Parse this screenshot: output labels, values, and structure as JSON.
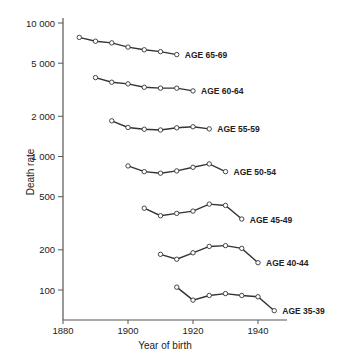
{
  "chart_data": {
    "type": "line",
    "title": "",
    "xlabel": "Year of birth",
    "ylabel": "Death rate",
    "yscale": "log",
    "xlim": [
      1880,
      1950
    ],
    "ylim": [
      60,
      10000
    ],
    "x_ticks": [
      1880,
      1900,
      1920,
      1940
    ],
    "x_tick_labels": [
      "1880",
      "1900",
      "1920",
      "1940"
    ],
    "y_ticks": [
      10000,
      5000,
      2000,
      1000,
      500,
      200,
      100
    ],
    "y_tick_labels": [
      "10 000",
      "5 000",
      "2 000",
      "1 000",
      "500",
      "200",
      "100"
    ],
    "grid": false,
    "legend": "inline labels at line ends",
    "series": [
      {
        "name": "AGE 65-69",
        "x": [
          1885,
          1890,
          1895,
          1900,
          1905,
          1910,
          1915
        ],
        "values": [
          7800,
          7300,
          7100,
          6600,
          6300,
          6100,
          5800
        ]
      },
      {
        "name": "AGE 60-64",
        "x": [
          1890,
          1895,
          1900,
          1905,
          1910,
          1915,
          1920
        ],
        "values": [
          3900,
          3600,
          3500,
          3300,
          3250,
          3250,
          3100
        ]
      },
      {
        "name": "AGE 55-59",
        "x": [
          1895,
          1900,
          1905,
          1910,
          1915,
          1920,
          1925
        ],
        "values": [
          1850,
          1650,
          1600,
          1580,
          1640,
          1670,
          1610
        ]
      },
      {
        "name": "AGE 50-54",
        "x": [
          1900,
          1905,
          1910,
          1915,
          1920,
          1925,
          1930
        ],
        "values": [
          850,
          770,
          750,
          780,
          830,
          880,
          770
        ]
      },
      {
        "name": "AGE 45-49",
        "x": [
          1905,
          1910,
          1915,
          1920,
          1925,
          1930,
          1935
        ],
        "values": [
          410,
          360,
          375,
          390,
          440,
          430,
          340
        ]
      },
      {
        "name": "AGE 40-44",
        "x": [
          1910,
          1915,
          1920,
          1925,
          1930,
          1935,
          1940
        ],
        "values": [
          185,
          170,
          190,
          212,
          215,
          205,
          160
        ]
      },
      {
        "name": "AGE 35-39",
        "x": [
          1915,
          1920,
          1925,
          1930,
          1935,
          1940,
          1945
        ],
        "values": [
          105,
          84,
          91,
          94,
          91,
          89,
          70
        ]
      }
    ]
  },
  "style": {
    "line_color": "#333333",
    "axis_color": "#555555",
    "marker_fill": "#ffffff"
  }
}
